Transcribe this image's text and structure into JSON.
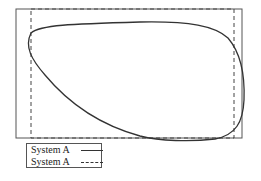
{
  "diagram": {
    "outer_frame": {
      "x": 16,
      "y": 9,
      "width": 226,
      "height": 129,
      "stroke": "#555555",
      "style": "solid"
    },
    "dashed_frame": {
      "x": 31,
      "y": 9,
      "width": 203,
      "height": 129,
      "stroke": "#444444",
      "style": "dashed"
    },
    "curve": {
      "stroke": "#333333",
      "style": "solid",
      "path": "M 31 33 C 40 25, 70 24, 140 22 C 190 21, 215 26, 228 38 C 240 52, 245 75, 244 100 C 243 122, 236 135, 215 139 C 190 142, 160 141, 140 136 C 100 125, 70 105, 45 75 C 32 60, 24 47, 31 33 Z"
    }
  },
  "legend": {
    "entries": [
      {
        "label": "System A",
        "line_style": "solid"
      },
      {
        "label": "System A",
        "line_style": "dashed"
      }
    ]
  }
}
